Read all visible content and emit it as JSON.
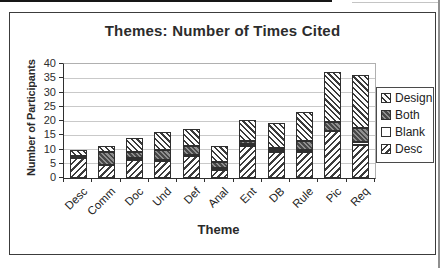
{
  "colors": {
    "ink": "#2f2f2f",
    "gridline": "#c9c9c9",
    "both_fill": "#6e6e6e",
    "background": "#ffffff"
  },
  "chart_data": {
    "type": "bar",
    "stacked": true,
    "title": "Themes: Number of Times Cited",
    "xlabel": "Theme",
    "ylabel": "Number of Participants",
    "ylim": [
      0,
      40
    ],
    "yticks": [
      0,
      5,
      10,
      15,
      20,
      25,
      30,
      35,
      40
    ],
    "grid": true,
    "categories": [
      "Desc",
      "Comm",
      "Doc",
      "Und",
      "Def",
      "Anal",
      "Ent",
      "DB",
      "Rule",
      "Pic",
      "Req"
    ],
    "series": [
      {
        "name": "Desc",
        "pattern": "hatch-fwd",
        "values": [
          7.0,
          4.7,
          6.3,
          6.0,
          7.7,
          2.8,
          11.3,
          9.3,
          9.3,
          16.5,
          11.5
        ]
      },
      {
        "name": "Blank",
        "pattern": "white",
        "values": [
          0.7,
          0.0,
          0.7,
          0.3,
          0.3,
          0.8,
          0.7,
          0.4,
          0.7,
          0.0,
          1.3
        ]
      },
      {
        "name": "Both",
        "pattern": "dark",
        "values": [
          0.0,
          4.3,
          2.0,
          3.7,
          3.3,
          2.0,
          1.0,
          1.0,
          3.0,
          3.0,
          4.9
        ]
      },
      {
        "name": "Design",
        "pattern": "hatch-back",
        "values": [
          2.3,
          2.3,
          5.0,
          6.0,
          6.0,
          5.7,
          7.2,
          8.5,
          10.0,
          17.8,
          18.3
        ]
      }
    ],
    "totals": [
      10.0,
      11.3,
      14.0,
      16.0,
      17.3,
      11.3,
      20.2,
      19.2,
      23.0,
      37.3,
      36.0
    ],
    "legend": {
      "position": "right",
      "entries": [
        "Design",
        "Both",
        "Blank",
        "Desc"
      ]
    }
  }
}
